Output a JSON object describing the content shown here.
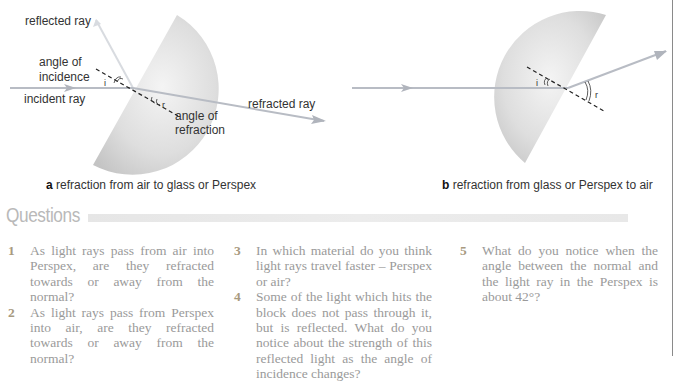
{
  "diagram_a": {
    "labels": {
      "reflected_ray": "reflected ray",
      "angle_of_incidence_1": "angle of",
      "angle_of_incidence_2": "incidence",
      "incident_ray": "incident ray",
      "refracted_ray": "refracted ray",
      "angle_of_refraction_1": "angle of",
      "angle_of_refraction_2": "refraction",
      "i": "i",
      "r": "r"
    },
    "caption_letter": "a",
    "caption_text": " refraction from air to glass or Perspex"
  },
  "diagram_b": {
    "labels": {
      "i": "i",
      "r": "r"
    },
    "caption_letter": "b",
    "caption_text": " refraction from glass or Perspex to air"
  },
  "questions": {
    "heading": "Questions",
    "items": [
      {
        "num": "1",
        "text": "As light rays pass from air into Perspex, are they refracted towards or away from the normal?"
      },
      {
        "num": "2",
        "text": "As light rays pass from Perspex into air, are they refracted towards or away from the normal?"
      },
      {
        "num": "3",
        "text": "In which material do you think light rays travel faster – Perspex or air?"
      },
      {
        "num": "4",
        "text": "Some of the light which hits the block does not pass through it, but is reflected. What do you notice about the strength of this reflected light as the angle of incidence changes?"
      },
      {
        "num": "5",
        "text": "What do you notice when the angle between the normal and the light ray in the Perspex is about 42°?"
      }
    ]
  },
  "colors": {
    "block_fill": "#d6d6d6",
    "ray": "#b8bcc4",
    "text": "#333333",
    "question_text": "#9a9a9a",
    "heading": "#b9b9b9"
  }
}
